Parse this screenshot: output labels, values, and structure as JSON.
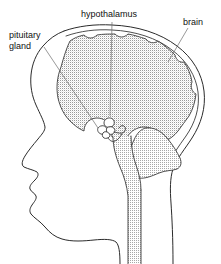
{
  "figure": {
    "background_color": "#ffffff",
    "line_color": "#2b2b2b",
    "leader_color": "#6d6d6d",
    "stipple_color": "#9a9a9a",
    "text_color": "#111111"
  },
  "labels": {
    "hypothalamus": "hypothalamus",
    "brain": "brain",
    "pituitary_line1": "pituitary",
    "pituitary_line2": "gland"
  },
  "structures": {
    "head_profile": "head-profile",
    "skull": "skull-outline",
    "cerebrum": "cerebrum",
    "cerebellum": "cerebellum",
    "brainstem": "brainstem",
    "spinal_cord": "spinal-cord",
    "pituitary_gland": "pituitary-gland",
    "hypothalamus": "hypothalamus-region",
    "neck": "neck-outline"
  }
}
